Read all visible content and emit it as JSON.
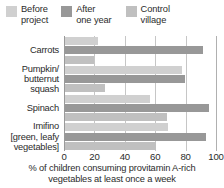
{
  "chart_data": {
    "type": "bar",
    "orientation": "horizontal",
    "title": "",
    "xlabel": "% of children consuming provitamin A-rich\nvegetables at least once a week",
    "ylabel": "",
    "xlim": [
      0,
      100
    ],
    "xticks": [
      0,
      20,
      40,
      60,
      80,
      100
    ],
    "grid": true,
    "legend_position": "top",
    "categories": [
      "Carrots",
      "Pumpkin/\nbutternut\nsquash",
      "Spinach",
      "Imifino\n[green, leafy\nvegetables]"
    ],
    "series": [
      {
        "name": "Before\nproject",
        "color": "#d0d0d0",
        "values": [
          22,
          77,
          56,
          68
        ]
      },
      {
        "name": "After\none year",
        "color": "#989898",
        "values": [
          91,
          79,
          95,
          93
        ]
      },
      {
        "name": "Control\nvillage",
        "color": "#c0c0c0",
        "values": [
          19,
          26,
          67,
          60
        ]
      }
    ]
  },
  "legend": {
    "items": [
      {
        "label": "Before\nproject",
        "swatch_name": "legend-swatch-before-project"
      },
      {
        "label": "After\none year",
        "swatch_name": "legend-swatch-after-one-year"
      },
      {
        "label": "Control\nvillage",
        "swatch_name": "legend-swatch-control-village"
      }
    ]
  },
  "axis": {
    "tick_labels": [
      "0",
      "20",
      "40",
      "60",
      "80",
      "100"
    ]
  },
  "caption": "% of children consuming provitamin A-rich\nvegetables at least once a week",
  "colors": {
    "before_project": "#d0d0d0",
    "after_one_year": "#989898",
    "control_village": "#c0c0c0",
    "gridline": "#c6c6c6",
    "axis": "#9a9a9a",
    "text": "#2b2b2b"
  }
}
